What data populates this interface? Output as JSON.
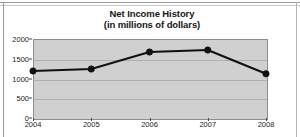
{
  "chart_data": {
    "type": "line",
    "title": "Net Income History",
    "subtitle": "(in millions of dollars)",
    "title_lines": [
      "Net Income History",
      "(in millions of dollars)"
    ],
    "xlabel": "",
    "ylabel": "",
    "categories": [
      "2004",
      "2005",
      "2006",
      "2007",
      "2008"
    ],
    "x": [
      2004,
      2005,
      2006,
      2007,
      2008
    ],
    "values": [
      1190,
      1240,
      1670,
      1720,
      1120
    ],
    "series": [
      {
        "name": "Net Income",
        "values": [
          1190,
          1240,
          1670,
          1720,
          1120
        ]
      }
    ],
    "xtick_labels": [
      "2004",
      "2005",
      "2006",
      "2007",
      "2008"
    ],
    "ytick_labels": [
      "0",
      "500",
      "1000",
      "1500",
      "2000"
    ],
    "yticks": [
      0,
      500,
      1000,
      1500,
      2000
    ],
    "ylim": [
      0,
      2000
    ],
    "grid": "horizontal",
    "legend": "none",
    "marker": "circle",
    "colors": {
      "line": "#111111",
      "marker": "#111111",
      "plot_background": "#d0d0d0",
      "gridline": "#b0b0b0",
      "axis": "#8e8e8e",
      "text": "#1c1c1c",
      "figure_background": "#ffffff"
    }
  }
}
